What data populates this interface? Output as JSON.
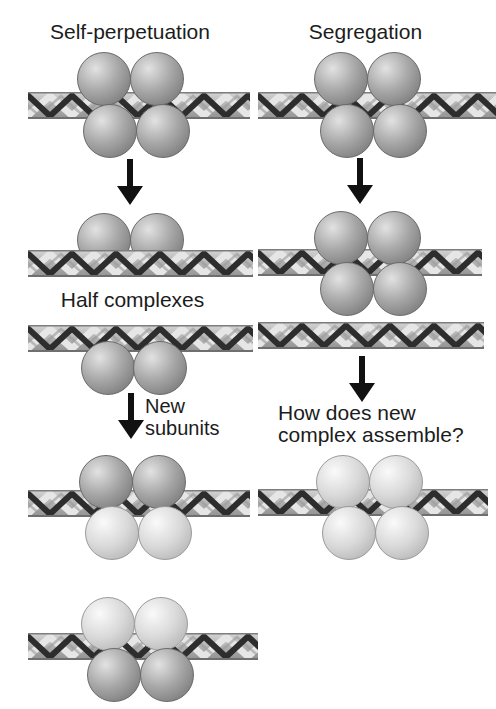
{
  "figure": {
    "background": "#ffffff",
    "left_column": {
      "title": "Self-perpetuation",
      "half_complexes_label": "Half complexes",
      "new_subunits_label": [
        "New",
        "subunits"
      ]
    },
    "right_column": {
      "title": "Segregation",
      "question_label": [
        "How does new",
        "complex assemble?"
      ]
    },
    "colors": {
      "old_subunit": "#a8a8a8",
      "new_subunit": "#d9d9d9",
      "dna_base": "#b6b6b6",
      "dna_edge": "#7d7d7d",
      "dna_strand_dark": "#2d2d2d",
      "dna_strand_light": "#e6e6e6",
      "arrow": "#111111",
      "text": "#1c1c1c"
    },
    "icons": {
      "down_arrow": "▼"
    }
  }
}
